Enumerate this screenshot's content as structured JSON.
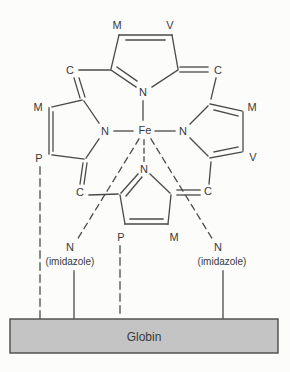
{
  "colors": {
    "background": "#fcfcfa",
    "line": "#4a4a4a",
    "text": "#3a3a3a",
    "globin_fill": "#c4c4c4",
    "globin_border": "#4a4a4a"
  },
  "molecule": {
    "center_atom": "Fe",
    "ring_nitrogens": {
      "top": "N",
      "left": "N",
      "right": "N",
      "bottom": "N"
    },
    "methine_bridges": {
      "top_left": "C",
      "top_right": "C",
      "bottom_left": "C",
      "bottom_right": "C"
    },
    "substituents": {
      "top_pyrrole": {
        "left": "M",
        "right": "V"
      },
      "left_pyrrole": {
        "top": "M",
        "bottom": "P"
      },
      "right_pyrrole": {
        "top": "M",
        "bottom": "V"
      },
      "bottom_pyrrole": {
        "left": "P",
        "right": "M"
      }
    },
    "axial_ligands": {
      "left": {
        "atom": "N",
        "group": "(imidazole)"
      },
      "right": {
        "atom": "N",
        "group": "(imidazole)"
      }
    },
    "protein": {
      "label": "Globin"
    }
  }
}
